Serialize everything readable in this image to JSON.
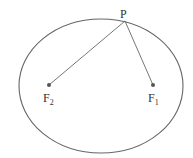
{
  "diagram": {
    "colors": {
      "stroke": "#555555",
      "text": "#333333",
      "background": "#ffffff"
    },
    "ellipse": {
      "cx": 101,
      "cy": 86,
      "rx": 82,
      "ry": 67
    },
    "point_P": {
      "label": "P",
      "x": 125,
      "y": 21
    },
    "focus_1": {
      "label": "F",
      "subscript": "1",
      "x": 153,
      "y": 85
    },
    "focus_2": {
      "label": "F",
      "subscript": "2",
      "x": 49,
      "y": 85
    }
  }
}
